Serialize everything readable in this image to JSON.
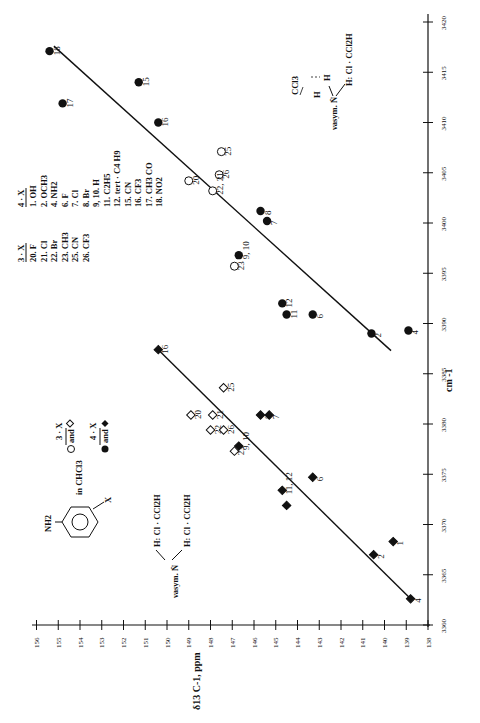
{
  "chart_data": {
    "type": "scatter",
    "orientation": "rotated-90-ccw",
    "title": "",
    "xlabel": "δ13 C-1, ppm",
    "ylabel": "cm -1",
    "xlim": [
      156,
      138
    ],
    "ylim": [
      3360,
      3420
    ],
    "x_ticks": [
      156,
      155,
      154,
      153,
      152,
      151,
      150,
      149,
      148,
      147,
      146,
      145,
      144,
      143,
      142,
      141,
      140,
      139,
      138
    ],
    "y_ticks": [
      3360,
      3365,
      3370,
      3375,
      3380,
      3385,
      3390,
      3395,
      3400,
      3405,
      3410,
      3415,
      3420
    ],
    "grid": false,
    "series": [
      {
        "name": "4-X (upper, circles, filled)",
        "marker": "circle-filled",
        "points": [
          {
            "label": "18",
            "x": 155.4,
            "y": 3417.1
          },
          {
            "label": "17",
            "x": 154.8,
            "y": 3411.9
          },
          {
            "label": "15",
            "x": 151.3,
            "y": 3414.0
          },
          {
            "label": "16",
            "x": 150.4,
            "y": 3410.0
          },
          {
            "label": "8",
            "x": 145.7,
            "y": 3401.2
          },
          {
            "label": "7",
            "x": 145.4,
            "y": 3400.2
          },
          {
            "label": "9, 10",
            "x": 146.7,
            "y": 3396.8
          },
          {
            "label": "12",
            "x": 144.7,
            "y": 3392.0
          },
          {
            "label": "11",
            "x": 144.5,
            "y": 3390.9
          },
          {
            "label": "6",
            "x": 143.3,
            "y": 3390.9
          },
          {
            "label": "2",
            "x": 140.6,
            "y": 3389.0
          },
          {
            "label": "4",
            "x": 138.9,
            "y": 3389.3
          }
        ]
      },
      {
        "name": "3-X (upper, circles, open)",
        "marker": "circle-open",
        "points": [
          {
            "label": "25",
            "x": 147.5,
            "y": 3407.1
          },
          {
            "label": "26",
            "x": 147.6,
            "y": 3404.8
          },
          {
            "label": "20",
            "x": 149.0,
            "y": 3404.2
          },
          {
            "label": "22, 21",
            "x": 147.9,
            "y": 3403.2
          },
          {
            "label": "23",
            "x": 146.9,
            "y": 3395.7
          }
        ]
      },
      {
        "name": "4-X (lower, diamonds, filled)",
        "marker": "diamond-filled",
        "points": [
          {
            "label": "16",
            "x": 150.4,
            "y": 3387.4
          },
          {
            "label": "8",
            "x": 145.7,
            "y": 3380.9
          },
          {
            "label": "7",
            "x": 145.3,
            "y": 3380.9
          },
          {
            "label": "9, 10",
            "x": 146.7,
            "y": 3377.8
          },
          {
            "label": "6",
            "x": 143.3,
            "y": 3374.7
          },
          {
            "label": "11, 12",
            "x": 144.7,
            "y": 3373.4
          },
          {
            "label": "",
            "x": 144.5,
            "y": 3371.9
          },
          {
            "label": "2",
            "x": 140.5,
            "y": 3367.0
          },
          {
            "label": "1",
            "x": 139.6,
            "y": 3368.3
          },
          {
            "label": "4",
            "x": 138.8,
            "y": 3362.6
          }
        ]
      },
      {
        "name": "3-X (lower, diamonds, open)",
        "marker": "diamond-open",
        "points": [
          {
            "label": "25",
            "x": 147.4,
            "y": 3383.6
          },
          {
            "label": "20",
            "x": 148.9,
            "y": 3380.9
          },
          {
            "label": "21",
            "x": 147.9,
            "y": 3380.9
          },
          {
            "label": "22",
            "x": 148.0,
            "y": 3379.4
          },
          {
            "label": "26",
            "x": 147.4,
            "y": 3379.4
          },
          {
            "label": "23",
            "x": 146.9,
            "y": 3377.3
          }
        ]
      }
    ],
    "fit_lines": [
      {
        "name": "upper (circles)",
        "x1": 155.2,
        "y1": 3417.6,
        "x2": 139.7,
        "y2": 3387.3
      },
      {
        "name": "lower (diamonds)",
        "x1": 150.4,
        "y1": 3387.4,
        "x2": 138.8,
        "y2": 3362.6
      }
    ],
    "legend_4X": {
      "header": "4 · X",
      "items": [
        "1. OH",
        "2. OCH3",
        "4. NH2",
        "6. F",
        "7. Cl",
        "8. Br",
        "9, 10. H",
        "11. C2H5",
        "12. tert · C4 H9",
        "15. CN",
        "16. CF3",
        "17. CH3 CO",
        "18. NO2"
      ]
    },
    "legend_3X": {
      "header": "3 · X",
      "items": [
        "20. F",
        "21. Cl",
        "22. Br",
        "23. CH3",
        "25. CN",
        "26. CF3"
      ]
    },
    "marker_legend": {
      "line1": "3 · X",
      "line1b": "○ and ◇",
      "line2": "4 · X",
      "line2b": "● and ◆"
    },
    "annotations": {
      "solvent": "in CHCl3",
      "nh2": "NH2",
      "x_sub": "X",
      "vasym_lower": "νasym. N̈",
      "hbond_lower_1": "H: Cl · CCl2H",
      "hbond_lower_2": "H: Cl · CCl2H",
      "vasym_upper": "νasym. N̈",
      "hbond_upper": "H: Cl · CCl2H",
      "ccl3": "CCl3",
      "h1": "H",
      "h2": "H"
    }
  }
}
